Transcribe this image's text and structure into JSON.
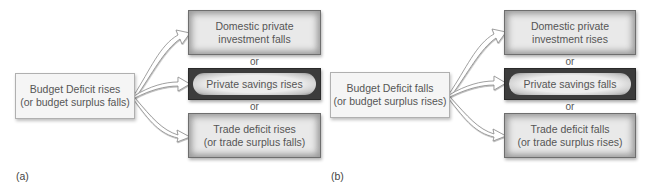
{
  "panels": [
    {
      "label": "(a)",
      "source": {
        "line1": "Budget Deficit rises",
        "line2": "(or budget surplus falls)"
      },
      "targets": [
        {
          "line1": "Domestic private",
          "line2": "investment falls",
          "style": "light"
        },
        {
          "line1": "Private savings rises",
          "line2": "",
          "style": "dark"
        },
        {
          "line1": "Trade deficit rises",
          "line2": "(or trade surplus falls)",
          "style": "light"
        }
      ],
      "connectors": [
        "or",
        "or"
      ]
    },
    {
      "label": "(b)",
      "source": {
        "line1": "Budget Deficit falls",
        "line2": "(or budget surplus rises)"
      },
      "targets": [
        {
          "line1": "Domestic private",
          "line2": "investment rises",
          "style": "light"
        },
        {
          "line1": "Private savings falls",
          "line2": "",
          "style": "dark"
        },
        {
          "line1": "Trade deficit falls",
          "line2": "(or trade surplus rises)",
          "style": "light"
        }
      ],
      "connectors": [
        "or",
        "or"
      ]
    }
  ],
  "colors": {
    "text": "#555555",
    "box_light_fill": "#e9e9e9",
    "box_light_border": "#6e6e6e",
    "box_dark_border": "#3c3c3c",
    "source_fill": "#f5f5f5",
    "source_border": "#b0b0b0",
    "arrow_fill": "#ffffff",
    "arrow_stroke": "#8a8a8a"
  }
}
